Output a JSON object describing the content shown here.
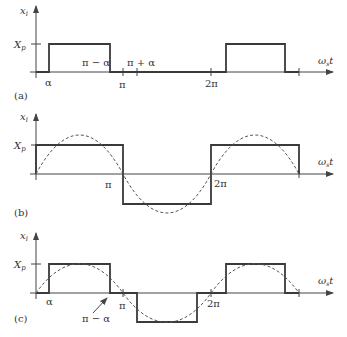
{
  "figure": {
    "colors": {
      "wave": "#3a3a3a",
      "axis": "#444444",
      "sine": "#555555",
      "text": "#333333"
    },
    "panels": [
      {
        "id": "a",
        "tag": "(a)",
        "y_label": "x",
        "y_label_sub": "i",
        "level_label": "X",
        "level_label_sub": "p",
        "x_label": "ω",
        "x_label_sub": "s",
        "x_label_suffix": "t",
        "ticks": {
          "alpha": "α",
          "pi_minus_alpha": "π − α",
          "pi": "π",
          "pi_plus_alpha": "π + α",
          "two_pi": "2π"
        },
        "description": "Unipolar pulse of height Xp from α to π−α, repeating each 2π"
      },
      {
        "id": "b",
        "tag": "(b)",
        "y_label": "x",
        "y_label_sub": "i",
        "level_label": "X",
        "level_label_sub": "p",
        "x_label": "ω",
        "x_label_sub": "s",
        "x_label_suffix": "t",
        "ticks": {
          "pi": "π",
          "two_pi": "2π"
        },
        "description": "Square wave ±Xp with dashed fundamental sinusoid"
      },
      {
        "id": "c",
        "tag": "(c)",
        "y_label": "x",
        "y_label_sub": "i",
        "level_label": "X",
        "level_label_sub": "p",
        "x_label": "ω",
        "x_label_sub": "s",
        "x_label_suffix": "t",
        "ticks": {
          "alpha": "α",
          "pi_minus_alpha": "π − α",
          "pi": "π",
          "two_pi": "2π"
        },
        "description": "Quasi-square wave ±Xp with zero intervals of width α and dashed fundamental"
      }
    ]
  }
}
